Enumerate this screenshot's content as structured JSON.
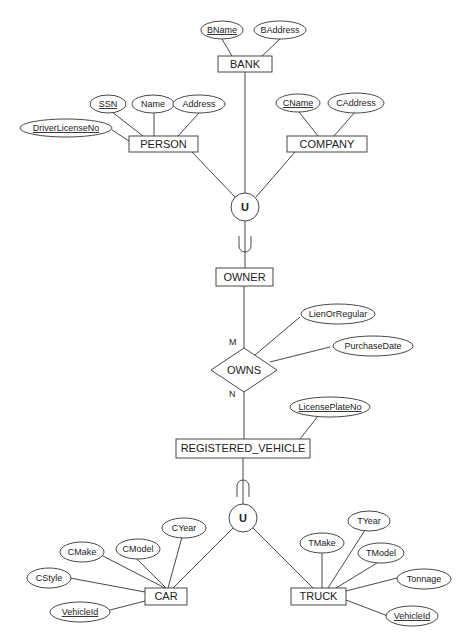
{
  "diagram": {
    "type": "EER diagram",
    "entities": {
      "bank": {
        "label": "BANK",
        "attributes": [
          {
            "name": "BName",
            "key": true
          },
          {
            "name": "BAddress",
            "key": false
          }
        ]
      },
      "person": {
        "label": "PERSON",
        "attributes": [
          {
            "name": "SSN",
            "key": true
          },
          {
            "name": "Name",
            "key": false
          },
          {
            "name": "Address",
            "key": false
          },
          {
            "name": "DriverLicenseNo",
            "key": true
          }
        ]
      },
      "company": {
        "label": "COMPANY",
        "attributes": [
          {
            "name": "CName",
            "key": true
          },
          {
            "name": "CAddress",
            "key": false
          }
        ]
      },
      "owner": {
        "label": "OWNER"
      },
      "registered_vehicle": {
        "label": "REGISTERED_VEHICLE",
        "attributes": [
          {
            "name": "LicensePlateNo",
            "key": true
          }
        ]
      },
      "car": {
        "label": "CAR",
        "attributes": [
          {
            "name": "CMake",
            "key": false
          },
          {
            "name": "CModel",
            "key": false
          },
          {
            "name": "CYear",
            "key": false
          },
          {
            "name": "CStyle",
            "key": false
          },
          {
            "name": "VehicleId",
            "key": true
          }
        ]
      },
      "truck": {
        "label": "TRUCK",
        "attributes": [
          {
            "name": "TMake",
            "key": false
          },
          {
            "name": "TYear",
            "key": false
          },
          {
            "name": "TModel",
            "key": false
          },
          {
            "name": "Tonnage",
            "key": false
          },
          {
            "name": "VehicleId",
            "key": true
          }
        ]
      }
    },
    "relationship": {
      "label": "OWNS",
      "cardinality_owner": "M",
      "cardinality_vehicle": "N",
      "attributes": [
        {
          "name": "LienOrRegular"
        },
        {
          "name": "PurchaseDate"
        }
      ]
    },
    "union_symbols": [
      "U",
      "U"
    ]
  }
}
